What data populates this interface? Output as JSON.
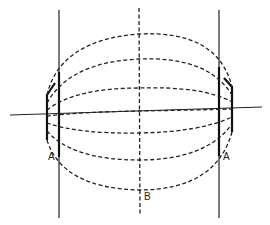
{
  "diagram": {
    "labels": {
      "left_A": "A",
      "right_A": "A",
      "bottom_B": "B"
    },
    "arc_count": 7
  }
}
